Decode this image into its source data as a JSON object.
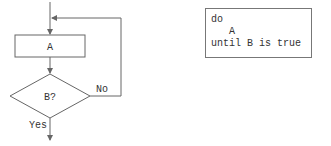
{
  "flowchart": {
    "process_label": "A",
    "decision_label": "B?",
    "no_label": "No",
    "yes_label": "Yes"
  },
  "pseudocode": {
    "lines": [
      "do",
      "   A",
      "until B is true"
    ]
  },
  "colors": {
    "stroke": "#666666",
    "text": "#333333"
  }
}
